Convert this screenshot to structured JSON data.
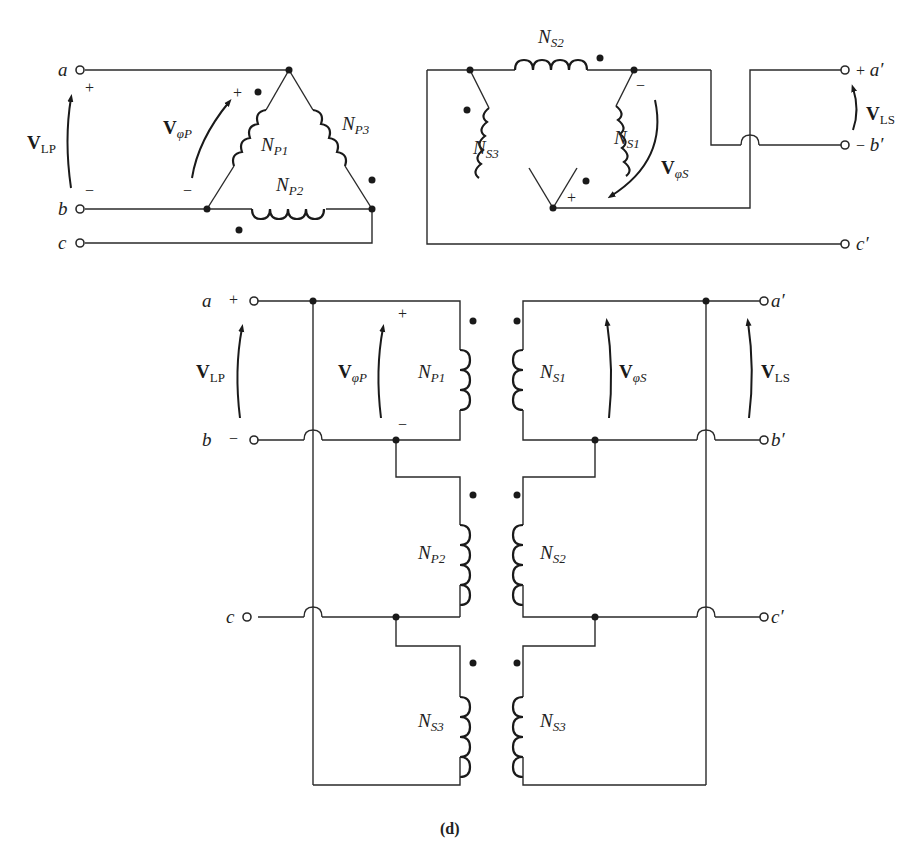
{
  "figure": {
    "caption": "(d)"
  },
  "top_left_delta": {
    "terminals": {
      "a": "a",
      "b": "b",
      "c": "c"
    },
    "polarity": {
      "line_plus": "+",
      "line_minus": "−",
      "phase_plus": "+",
      "phase_minus": "−"
    },
    "voltages": {
      "line": {
        "main": "V",
        "sub": "LP"
      },
      "phase": {
        "main": "V",
        "sub_greek": "φ",
        "sub": "P"
      }
    },
    "coils": [
      {
        "main": "N",
        "sub": "P1"
      },
      {
        "main": "N",
        "sub": "P2"
      },
      {
        "main": "N",
        "sub": "P3"
      }
    ]
  },
  "top_right_delta": {
    "terminals": {
      "a": "a′",
      "b": "b′",
      "c": "c′"
    },
    "polarity": {
      "line_plus": "+",
      "line_minus": "−",
      "phase_plus": "+",
      "phase_minus": "−"
    },
    "voltages": {
      "line": {
        "main": "V",
        "sub": "LS"
      },
      "phase": {
        "main": "V",
        "sub_greek": "φ",
        "sub": "S"
      }
    },
    "coils": [
      {
        "main": "N",
        "sub": "S1"
      },
      {
        "main": "N",
        "sub": "S2"
      },
      {
        "main": "N",
        "sub": "S3"
      }
    ]
  },
  "bottom_wiring": {
    "primary_terminals": {
      "a": "a",
      "b": "b",
      "c": "c"
    },
    "secondary_terminals": {
      "a": "a′",
      "b": "b′",
      "c": "c′"
    },
    "polarity": {
      "a_plus": "+",
      "b_minus": "−",
      "phase_plus": "+",
      "phase_minus": "−"
    },
    "voltages": {
      "line_primary": {
        "main": "V",
        "sub": "LP"
      },
      "phase_primary": {
        "main": "V",
        "sub_greek": "φ",
        "sub": "P"
      },
      "phase_secondary": {
        "main": "V",
        "sub_greek": "φ",
        "sub": "S"
      },
      "line_secondary": {
        "main": "V",
        "sub": "LS"
      }
    },
    "primary_coils": [
      {
        "main": "N",
        "sub": "P1"
      },
      {
        "main": "N",
        "sub": "P2"
      },
      {
        "main": "N",
        "sub": "S3"
      }
    ],
    "secondary_coils": [
      {
        "main": "N",
        "sub": "S1"
      },
      {
        "main": "N",
        "sub": "S2"
      },
      {
        "main": "N",
        "sub": "S3"
      }
    ]
  }
}
